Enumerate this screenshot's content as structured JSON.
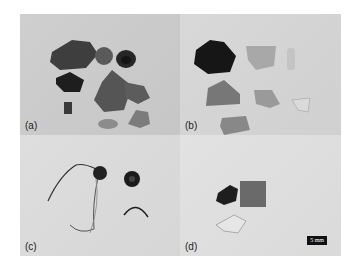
{
  "figure": {
    "panels": [
      {
        "id": "a",
        "label": "(a)"
      },
      {
        "id": "b",
        "label": "(b)"
      },
      {
        "id": "c",
        "label": "(c)"
      },
      {
        "id": "d",
        "label": "(d)"
      }
    ],
    "scale_bar": {
      "label": "5 mm"
    }
  }
}
